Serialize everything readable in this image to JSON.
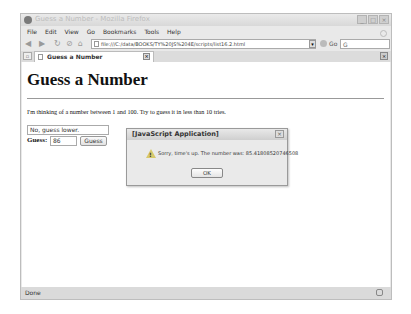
{
  "window": {
    "title": "Guess a Number - Mozilla Firefox",
    "controls": {
      "minimize": "_",
      "maximize": "□",
      "close": "×"
    }
  },
  "menubar": {
    "items": [
      {
        "label": "File"
      },
      {
        "label": "Edit"
      },
      {
        "label": "View"
      },
      {
        "label": "Go"
      },
      {
        "label": "Bookmarks"
      },
      {
        "label": "Tools"
      },
      {
        "label": "Help"
      }
    ]
  },
  "navbar": {
    "back": "◀",
    "forward": "▶",
    "reload": "↻",
    "stop": "⊘",
    "home": "⌂",
    "url": "file:///C:/data/BOOKS/TY%20JS%204E/scripts/list16.2.html",
    "url_dropdown": "▾",
    "go_label": "Go",
    "search_icon": "G"
  },
  "tabs": {
    "list_button": "▫",
    "items": [
      {
        "label": "Guess a Number"
      }
    ],
    "close_tab": "×",
    "close_all": "×"
  },
  "page": {
    "heading": "Guess a Number",
    "intro": "I'm thinking of a number between 1 and 100. Try to guess it in less than 10 tries.",
    "message_field_value": "No, guess lower.",
    "guess_label": "Guess:",
    "guess_value": "86",
    "guess_button": "Guess"
  },
  "dialog": {
    "title": "[JavaScript Application]",
    "close": "×",
    "icon": "warning-icon",
    "message": "Sorry, time's up. The number was: 85.41808520746508",
    "ok_label": "OK"
  },
  "statusbar": {
    "text": "Done"
  }
}
